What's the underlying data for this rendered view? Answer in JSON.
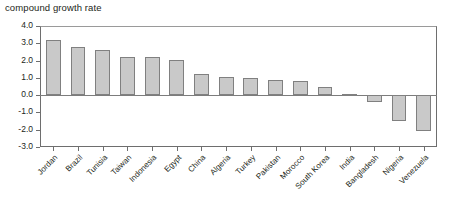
{
  "chart_data": {
    "type": "bar",
    "title": "compound growth rate",
    "xlabel": "",
    "ylabel": "",
    "ylim": [
      -3.0,
      4.0
    ],
    "yticks": [
      4.0,
      3.0,
      2.0,
      1.0,
      0.0,
      -1.0,
      -2.0,
      -3.0
    ],
    "ytick_labels": [
      "4.0",
      "3.0",
      "2.0",
      "1.0",
      "0.0",
      "-1.0",
      "-2.0",
      "-3.0"
    ],
    "grid": false,
    "legend": null,
    "bar_color": "#c9c9c9",
    "bar_edge_color": "#808080",
    "axis_color": "#6e6e6e",
    "zero_line": 0.0,
    "categories": [
      "Jordan",
      "Brazil",
      "Tunisia",
      "Taiwan",
      "Indonesia",
      "Egypt",
      "China",
      "Algeria",
      "Turkey",
      "Pakistan",
      "Morocco",
      "South Korea",
      "India",
      "Bangladesh",
      "Nigeria",
      "Venezuela"
    ],
    "values": [
      3.2,
      2.8,
      2.6,
      2.2,
      2.2,
      2.05,
      1.2,
      1.05,
      1.0,
      0.85,
      0.8,
      0.5,
      0.07,
      -0.4,
      -1.5,
      -2.05
    ]
  }
}
